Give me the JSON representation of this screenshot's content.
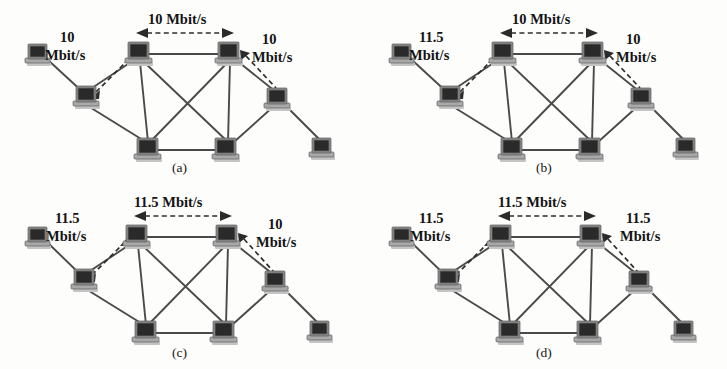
{
  "figure": {
    "background_color": "#fdfdfc",
    "node_color": "#2a2a2a",
    "link_color": "#4a4a4a",
    "arrow_color": "#2b2b2b",
    "node_icon_name": "computer-workstation-icon",
    "panel_count": 4
  },
  "panels": [
    {
      "id": "a",
      "caption": "(a)",
      "labels": {
        "left": {
          "line1": "10",
          "line2": "Mbit/s"
        },
        "top": {
          "line1": "10 Mbit/s"
        },
        "right": {
          "line1": "10",
          "line2": "Mbit/s"
        }
      }
    },
    {
      "id": "b",
      "caption": "(b)",
      "labels": {
        "left": {
          "line1": "11.5",
          "line2": "Mbit/s"
        },
        "top": {
          "line1": "10 Mbit/s"
        },
        "right": {
          "line1": "10",
          "line2": "Mbit/s"
        }
      }
    },
    {
      "id": "c",
      "caption": "(c)",
      "labels": {
        "left": {
          "line1": "11.5",
          "line2": "Mbit/s"
        },
        "top": {
          "line1": "11.5 Mbit/s"
        },
        "right": {
          "line1": "10",
          "line2": "Mbit/s"
        }
      }
    },
    {
      "id": "d",
      "caption": "(d)",
      "labels": {
        "left": {
          "line1": "11.5",
          "line2": "Mbit/s"
        },
        "top": {
          "line1": "11.5 Mbit/s"
        },
        "right": {
          "line1": "11.5",
          "line2": "Mbit/s"
        }
      }
    }
  ],
  "topology": {
    "nodes": [
      {
        "name": "far-left-host",
        "x": 38,
        "y": 55
      },
      {
        "name": "left-access",
        "x": 86,
        "y": 95
      },
      {
        "name": "core-top-left",
        "x": 138,
        "y": 52
      },
      {
        "name": "core-top-right",
        "x": 228,
        "y": 52
      },
      {
        "name": "core-bottom-left",
        "x": 148,
        "y": 148
      },
      {
        "name": "core-bottom-right",
        "x": 226,
        "y": 148
      },
      {
        "name": "right-access",
        "x": 277,
        "y": 97
      },
      {
        "name": "far-right-host",
        "x": 322,
        "y": 146
      }
    ],
    "links": [
      [
        "far-left-host",
        "left-access"
      ],
      [
        "left-access",
        "core-top-left"
      ],
      [
        "left-access",
        "core-bottom-left"
      ],
      [
        "core-top-left",
        "core-top-right"
      ],
      [
        "core-top-left",
        "core-bottom-left"
      ],
      [
        "core-top-left",
        "core-bottom-right"
      ],
      [
        "core-top-right",
        "core-bottom-left"
      ],
      [
        "core-top-right",
        "core-bottom-right"
      ],
      [
        "core-bottom-left",
        "core-bottom-right"
      ],
      [
        "core-top-right",
        "right-access"
      ],
      [
        "right-access",
        "core-bottom-right"
      ],
      [
        "right-access",
        "far-right-host"
      ]
    ],
    "annotated_flows": [
      {
        "name": "left-flow",
        "from": "left-access",
        "to": "core-top-left",
        "style": "dashed-double-arrow"
      },
      {
        "name": "top-flow",
        "from": "core-top-left",
        "to": "core-top-right",
        "style": "dashed-double-arrow"
      },
      {
        "name": "right-flow",
        "from": "core-top-right",
        "to": "right-access",
        "style": "dashed-double-arrow"
      }
    ]
  }
}
